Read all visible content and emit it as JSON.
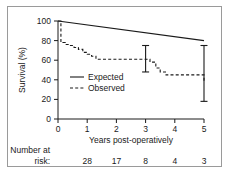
{
  "chart_data": {
    "type": "line",
    "title": "",
    "xlabel": "Years post-operatively",
    "ylabel": "Survival (%)",
    "xlim": [
      0,
      5
    ],
    "ylim": [
      0,
      100
    ],
    "xticks": [
      "0",
      "1",
      "2",
      "3",
      "4",
      "5"
    ],
    "yticks": [
      "0",
      "20",
      "40",
      "60",
      "80",
      "100"
    ],
    "grid": false,
    "legend_position": "center-left",
    "series": [
      {
        "name": "Expected",
        "style": "solid",
        "x": [
          0,
          5
        ],
        "values": [
          100,
          80
        ]
      },
      {
        "name": "Observed",
        "style": "dashed",
        "x": [
          0,
          0.1,
          0.25,
          0.4,
          0.55,
          0.7,
          0.85,
          1.0,
          1.15,
          1.3,
          3.0,
          3.15,
          3.35,
          3.5,
          3.7,
          4.0,
          5.0
        ],
        "values": [
          100,
          78,
          76,
          75,
          73,
          71,
          68,
          66,
          64,
          61,
          61,
          58,
          52,
          48,
          45,
          45,
          38
        ]
      }
    ],
    "error_bars": [
      {
        "x": 3,
        "value": 61,
        "low": 48,
        "high": 75
      },
      {
        "x": 5,
        "value": 38,
        "low": 18,
        "high": 75
      }
    ],
    "risk_table": {
      "label_line1": "Number at",
      "label_line2": "risk:",
      "x": [
        0,
        1,
        2,
        3,
        4,
        5
      ],
      "counts": [
        "28",
        "17",
        "8",
        "4",
        "3"
      ],
      "counts_x": [
        1,
        2,
        3,
        4,
        5
      ]
    }
  },
  "colors": {
    "ink": "#1a1a1a",
    "frame": "#9a9a9a",
    "background": "#ffffff"
  }
}
